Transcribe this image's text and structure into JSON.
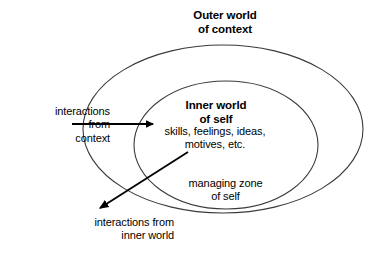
{
  "diagram": {
    "background_color": "#ffffff",
    "stroke_color": "#3a3a3a",
    "arrow_color": "#000000",
    "text_color": "#000000",
    "labels": {
      "outer_world_line1": "Outer world",
      "outer_world_line2": "of context",
      "inner_world_line1": "Inner world",
      "inner_world_line2": "of self",
      "inner_detail_line1": "skills, feelings, ideas,",
      "inner_detail_line2": "motives, etc.",
      "managing_zone_line1": "managing zone",
      "managing_zone_line2": "of self",
      "interactions_context_line1": "interactions",
      "interactions_context_line2": "from",
      "interactions_context_line3": "context",
      "interactions_inner_line1": "interactions from",
      "interactions_inner_line2": "inner world"
    },
    "shapes": [
      {
        "name": "outer-ellipse",
        "role": "outer world of context boundary",
        "cx": 223,
        "cy": 129,
        "rx": 140,
        "ry": 84
      },
      {
        "name": "inner-ellipse",
        "role": "inner world of self boundary",
        "cx": 226,
        "cy": 145,
        "rx": 92,
        "ry": 64
      }
    ],
    "arrows": [
      {
        "name": "arrow-interactions-from-context",
        "direction": "left-to-right",
        "x1": 72,
        "y1": 124,
        "x2": 155,
        "y2": 124
      },
      {
        "name": "arrow-interactions-from-inner-world",
        "direction": "upper-right-to-lower-left",
        "x1": 188,
        "y1": 152,
        "x2": 98,
        "y2": 210
      }
    ]
  }
}
